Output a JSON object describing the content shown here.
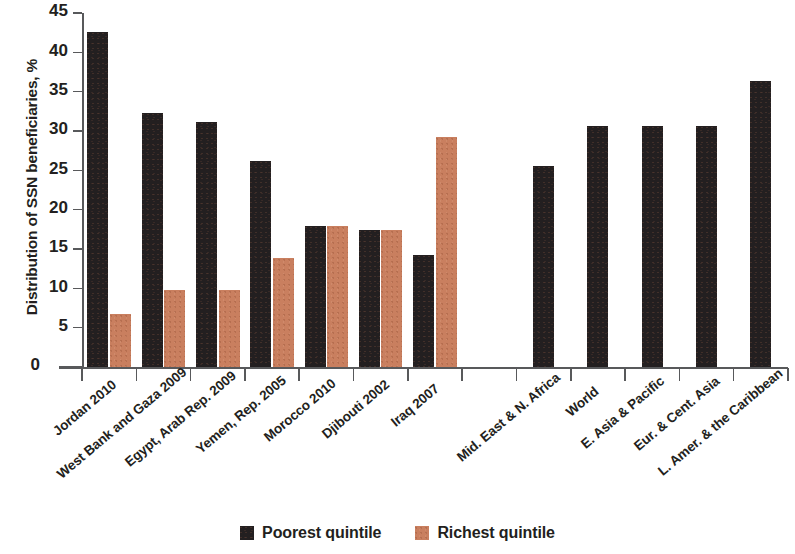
{
  "chart_data": {
    "type": "bar",
    "title": "",
    "xlabel": "",
    "ylabel": "Distribution of SSN beneficiaries, %",
    "ylim": [
      0,
      45
    ],
    "yticks": [
      0,
      5,
      10,
      15,
      20,
      25,
      30,
      35,
      40,
      45
    ],
    "ytick_labels": [
      "0",
      "5",
      "10",
      "15",
      "20",
      "25",
      "30",
      "35",
      "40",
      "45"
    ],
    "grid": false,
    "legend_position": "bottom-center",
    "categories": [
      "Jordan 2010",
      "West Bank and Gaza 2009",
      "Egypt, Arab Rep. 2009",
      "Yemen, Rep. 2005",
      "Morocco 2010",
      "Djibouti 2002",
      "Iraq 2007",
      "",
      "Mid. East & N. Africa",
      "World",
      "E. Asia & Pacific",
      "Eur. & Cent. Asia",
      "L. Amer. & the Caribbean"
    ],
    "series": [
      {
        "name": "Poorest quintile",
        "color": "#231f20",
        "values": [
          42.6,
          32.3,
          31.2,
          26.2,
          17.9,
          17.4,
          14.3,
          null,
          25.6,
          30.6,
          30.6,
          30.6,
          36.3
        ]
      },
      {
        "name": "Richest quintile",
        "color": "#c97f5f",
        "values": [
          6.7,
          9.8,
          9.8,
          13.9,
          17.9,
          17.4,
          29.2,
          null,
          null,
          null,
          null,
          null,
          null
        ]
      }
    ],
    "legend": [
      {
        "label": "Poorest quintile",
        "color": "#231f20"
      },
      {
        "label": "Richest quintile",
        "color": "#c97f5f"
      }
    ]
  }
}
